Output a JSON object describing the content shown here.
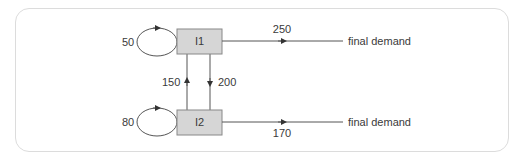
{
  "diagram": {
    "type": "input-output flow diagram",
    "colors": {
      "frame_border": "#dcdcdc",
      "box_fill": "#d6d6d6",
      "box_border": "#888888",
      "line": "#555555",
      "text": "#3a3a3a"
    },
    "nodes": [
      {
        "id": "I1",
        "label": "I1"
      },
      {
        "id": "I2",
        "label": "I2"
      }
    ],
    "self_loops": [
      {
        "node": "I1",
        "value": "50"
      },
      {
        "node": "I2",
        "value": "80"
      }
    ],
    "flows": [
      {
        "from": "I2",
        "to": "I1",
        "value": "150"
      },
      {
        "from": "I1",
        "to": "I2",
        "value": "200"
      },
      {
        "from": "I1",
        "to": "final demand",
        "value": "250"
      },
      {
        "from": "I2",
        "to": "final demand",
        "value": "170"
      }
    ],
    "final_demand_label": "final demand"
  }
}
